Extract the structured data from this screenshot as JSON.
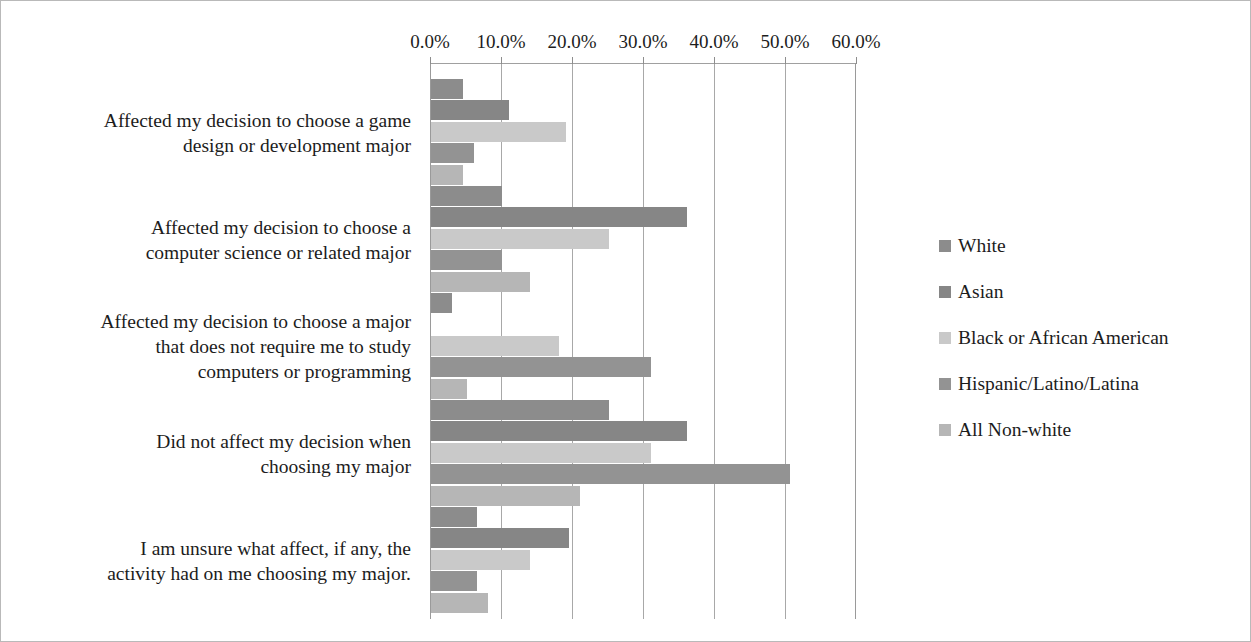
{
  "chart_data": {
    "type": "bar",
    "orientation": "horizontal",
    "title": "",
    "subtitle": "",
    "xlabel": "",
    "ylabel": "",
    "xlim": [
      0,
      60
    ],
    "xtick_labels": [
      "0.0%",
      "10.0%",
      "20.0%",
      "30.0%",
      "40.0%",
      "50.0%",
      "60.0%"
    ],
    "xtick_values": [
      0,
      10,
      20,
      30,
      40,
      50,
      60
    ],
    "grid": true,
    "legend_position": "right",
    "categories": [
      "Affected my decision to choose a game\ndesign or development major",
      "Affected my decision to choose a\ncomputer science or related major",
      "Affected my decision to choose a major\nthat does not require me to study\ncomputers or programming",
      "Did not affect my decision when\nchoosing my major",
      "I am unsure what affect, if any, the\nactivity had on me choosing my major."
    ],
    "series": [
      {
        "name": "White",
        "color": "#8c8c8c",
        "values": [
          4.5,
          10.0,
          3.0,
          25.0,
          6.5
        ]
      },
      {
        "name": "Asian",
        "color": "#868686",
        "values": [
          11.0,
          36.0,
          0.0,
          36.0,
          19.5
        ]
      },
      {
        "name": "Black or African American",
        "color": "#c9c9c9",
        "values": [
          19.0,
          25.0,
          18.0,
          31.0,
          14.0
        ]
      },
      {
        "name": "Hispanic/Latino/Latina",
        "color": "#939393",
        "values": [
          6.0,
          10.0,
          31.0,
          50.5,
          6.5
        ]
      },
      {
        "name": "All Non-white",
        "color": "#b6b6b6",
        "values": [
          4.5,
          14.0,
          5.0,
          21.0,
          8.0
        ]
      }
    ]
  },
  "axis": {
    "pixels_per_percent": 7.1,
    "origin_x": 429
  },
  "layout": {
    "group_tops": [
      78,
      185,
      292,
      399,
      506
    ],
    "bar_height": 20,
    "bar_pitch": 21.4
  }
}
